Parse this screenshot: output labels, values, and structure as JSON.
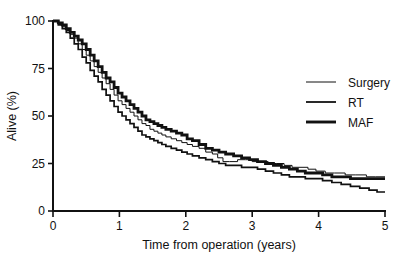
{
  "chart_data": {
    "type": "line",
    "title": "",
    "xlabel": "Time from operation (years)",
    "ylabel": "Alive (%)",
    "xlim": [
      0,
      5
    ],
    "ylim": [
      0,
      100
    ],
    "xticks": [
      "0",
      "1",
      "2",
      "3",
      "4",
      "5"
    ],
    "yticks": [
      "0",
      "25",
      "50",
      "75",
      "100"
    ],
    "grid": false,
    "legend_position": "top-right",
    "series": [
      {
        "name": "Surgery",
        "line_weight": "thin",
        "color": "#111111",
        "points": [
          [
            0.0,
            100
          ],
          [
            0.08,
            99
          ],
          [
            0.14,
            97
          ],
          [
            0.2,
            95
          ],
          [
            0.26,
            93
          ],
          [
            0.32,
            91
          ],
          [
            0.38,
            88
          ],
          [
            0.44,
            85
          ],
          [
            0.5,
            82
          ],
          [
            0.56,
            79
          ],
          [
            0.62,
            76
          ],
          [
            0.68,
            73
          ],
          [
            0.74,
            70
          ],
          [
            0.8,
            67
          ],
          [
            0.86,
            64
          ],
          [
            0.92,
            61
          ],
          [
            0.98,
            58
          ],
          [
            1.04,
            56
          ],
          [
            1.1,
            54
          ],
          [
            1.16,
            52
          ],
          [
            1.22,
            50
          ],
          [
            1.28,
            48
          ],
          [
            1.34,
            46
          ],
          [
            1.4,
            45
          ],
          [
            1.46,
            43
          ],
          [
            1.52,
            42
          ],
          [
            1.58,
            41
          ],
          [
            1.64,
            40
          ],
          [
            1.7,
            39
          ],
          [
            1.78,
            38
          ],
          [
            1.86,
            37
          ],
          [
            1.94,
            36
          ],
          [
            2.02,
            35
          ],
          [
            2.1,
            34
          ],
          [
            2.2,
            33
          ],
          [
            2.3,
            31
          ],
          [
            2.4,
            30
          ],
          [
            2.48,
            28
          ],
          [
            2.56,
            26
          ],
          [
            2.66,
            26
          ],
          [
            2.78,
            27
          ],
          [
            2.9,
            27
          ],
          [
            3.0,
            26
          ],
          [
            3.12,
            26
          ],
          [
            3.24,
            25
          ],
          [
            3.36,
            25
          ],
          [
            3.48,
            24
          ],
          [
            3.6,
            23
          ],
          [
            3.72,
            23
          ],
          [
            3.84,
            22
          ],
          [
            3.96,
            21
          ],
          [
            4.1,
            20
          ],
          [
            4.24,
            20
          ],
          [
            4.4,
            19
          ],
          [
            4.56,
            19
          ],
          [
            4.72,
            18
          ],
          [
            4.86,
            18
          ],
          [
            5.0,
            18
          ]
        ]
      },
      {
        "name": "RT",
        "line_weight": "medium",
        "color": "#111111",
        "points": [
          [
            0.0,
            100
          ],
          [
            0.08,
            98
          ],
          [
            0.14,
            96
          ],
          [
            0.2,
            94
          ],
          [
            0.26,
            91
          ],
          [
            0.32,
            88
          ],
          [
            0.38,
            85
          ],
          [
            0.44,
            81
          ],
          [
            0.5,
            78
          ],
          [
            0.56,
            74
          ],
          [
            0.62,
            71
          ],
          [
            0.68,
            68
          ],
          [
            0.74,
            64
          ],
          [
            0.8,
            61
          ],
          [
            0.86,
            58
          ],
          [
            0.92,
            55
          ],
          [
            0.98,
            52
          ],
          [
            1.04,
            50
          ],
          [
            1.1,
            48
          ],
          [
            1.16,
            46
          ],
          [
            1.22,
            44
          ],
          [
            1.28,
            42
          ],
          [
            1.34,
            40
          ],
          [
            1.4,
            39
          ],
          [
            1.46,
            38
          ],
          [
            1.52,
            37
          ],
          [
            1.58,
            36
          ],
          [
            1.64,
            35
          ],
          [
            1.7,
            34
          ],
          [
            1.78,
            33
          ],
          [
            1.86,
            32
          ],
          [
            1.94,
            31
          ],
          [
            2.02,
            30
          ],
          [
            2.1,
            29
          ],
          [
            2.2,
            28
          ],
          [
            2.3,
            27
          ],
          [
            2.4,
            26
          ],
          [
            2.5,
            25
          ],
          [
            2.6,
            24
          ],
          [
            2.72,
            24
          ],
          [
            2.84,
            23
          ],
          [
            2.96,
            23
          ],
          [
            3.08,
            22
          ],
          [
            3.2,
            21
          ],
          [
            3.32,
            20
          ],
          [
            3.44,
            19
          ],
          [
            3.56,
            18
          ],
          [
            3.68,
            18
          ],
          [
            3.8,
            17
          ],
          [
            3.92,
            17
          ],
          [
            4.06,
            16
          ],
          [
            4.2,
            15
          ],
          [
            4.34,
            14
          ],
          [
            4.48,
            13
          ],
          [
            4.62,
            12
          ],
          [
            4.76,
            11
          ],
          [
            4.88,
            10
          ],
          [
            5.0,
            10
          ]
        ]
      },
      {
        "name": "MAF",
        "line_weight": "thick",
        "color": "#111111",
        "points": [
          [
            0.0,
            100
          ],
          [
            0.08,
            99
          ],
          [
            0.14,
            98
          ],
          [
            0.2,
            96
          ],
          [
            0.26,
            94
          ],
          [
            0.32,
            92
          ],
          [
            0.38,
            90
          ],
          [
            0.44,
            88
          ],
          [
            0.5,
            85
          ],
          [
            0.56,
            82
          ],
          [
            0.62,
            79
          ],
          [
            0.68,
            76
          ],
          [
            0.74,
            73
          ],
          [
            0.8,
            70
          ],
          [
            0.86,
            68
          ],
          [
            0.92,
            65
          ],
          [
            0.98,
            62
          ],
          [
            1.04,
            60
          ],
          [
            1.1,
            58
          ],
          [
            1.16,
            56
          ],
          [
            1.22,
            54
          ],
          [
            1.28,
            52
          ],
          [
            1.34,
            50
          ],
          [
            1.4,
            48
          ],
          [
            1.46,
            47
          ],
          [
            1.52,
            46
          ],
          [
            1.58,
            45
          ],
          [
            1.64,
            44
          ],
          [
            1.7,
            43
          ],
          [
            1.78,
            42
          ],
          [
            1.86,
            41
          ],
          [
            1.94,
            40
          ],
          [
            2.02,
            38
          ],
          [
            2.1,
            37
          ],
          [
            2.2,
            35
          ],
          [
            2.3,
            33
          ],
          [
            2.4,
            32
          ],
          [
            2.5,
            31
          ],
          [
            2.6,
            30
          ],
          [
            2.72,
            29
          ],
          [
            2.84,
            28
          ],
          [
            2.96,
            27
          ],
          [
            3.08,
            26
          ],
          [
            3.2,
            25
          ],
          [
            3.32,
            24
          ],
          [
            3.44,
            23
          ],
          [
            3.56,
            22
          ],
          [
            3.68,
            21
          ],
          [
            3.8,
            20
          ],
          [
            3.92,
            20
          ],
          [
            4.06,
            19
          ],
          [
            4.2,
            18
          ],
          [
            4.34,
            18
          ],
          [
            4.48,
            17
          ],
          [
            4.62,
            17
          ],
          [
            4.76,
            17
          ],
          [
            4.88,
            17
          ],
          [
            5.0,
            17
          ]
        ]
      }
    ]
  },
  "axes": {
    "y_title": "Alive (%)",
    "x_title": "Time from operation (years)",
    "y_tick_labels": [
      "100",
      "75",
      "50",
      "25",
      "0"
    ],
    "x_tick_labels": [
      "0",
      "1",
      "2",
      "3",
      "4",
      "5"
    ]
  },
  "legend": {
    "items": [
      {
        "label": "Surgery"
      },
      {
        "label": "RT"
      },
      {
        "label": "MAF"
      }
    ]
  }
}
